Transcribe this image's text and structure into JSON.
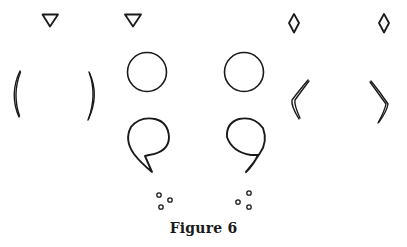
{
  "figure": {
    "caption": "Figure 6",
    "stroke_color": "#1a1a1a",
    "background": "#ffffff",
    "shapes": {
      "triangles": [
        {
          "name": "inverted-triangle-left",
          "cx": 50,
          "top": 14,
          "width": 16,
          "height": 13
        },
        {
          "name": "inverted-triangle-right",
          "cx": 133,
          "top": 14,
          "width": 16,
          "height": 13
        }
      ],
      "diamonds": [
        {
          "name": "diamond-left",
          "cx": 294,
          "cy": 23,
          "w": 10,
          "h": 19
        },
        {
          "name": "diamond-right",
          "cx": 384,
          "cy": 23,
          "w": 10,
          "h": 19
        }
      ],
      "circles": [
        {
          "name": "circle-left",
          "cx": 147,
          "cy": 72,
          "r": 19.5
        },
        {
          "name": "circle-right",
          "cx": 244,
          "cy": 72,
          "r": 19.5
        }
      ],
      "parentheses": [
        {
          "name": "left-parenthesis"
        },
        {
          "name": "right-parenthesis"
        }
      ],
      "angle_brackets": [
        {
          "name": "left-angle-bracket"
        },
        {
          "name": "right-angle-bracket"
        }
      ],
      "commas": [
        {
          "name": "comma-shape-left"
        },
        {
          "name": "comma-shape-right"
        }
      ],
      "dot_clusters": [
        {
          "name": "dot-cluster-left",
          "dots": [
            [
              159,
              195
            ],
            [
              170,
              200
            ],
            [
              161,
              207
            ]
          ],
          "r": 2.2
        },
        {
          "name": "dot-cluster-right",
          "dots": [
            [
              249,
              193
            ],
            [
              238,
              202
            ],
            [
              249,
              207
            ]
          ],
          "r": 2.2
        }
      ]
    }
  }
}
